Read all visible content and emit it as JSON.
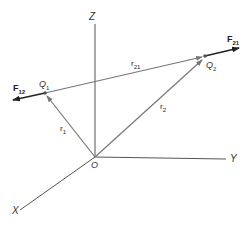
{
  "diagram": {
    "type": "vector-diagram",
    "colors": {
      "axis": "#555555",
      "vector": "#777777",
      "force": "#222222",
      "background": "#ffffff"
    },
    "axes": {
      "x": {
        "label": "X"
      },
      "y": {
        "label": "Y"
      },
      "z": {
        "label": "Z"
      },
      "origin": {
        "label": "O"
      }
    },
    "points": [
      {
        "id": "Q1",
        "label": "Q",
        "sub": "1"
      },
      {
        "id": "Q2",
        "label": "Q",
        "sub": "2"
      }
    ],
    "vectors": [
      {
        "id": "r1",
        "label": "r",
        "sub": "1",
        "from": "O",
        "to": "Q1"
      },
      {
        "id": "r2",
        "label": "r",
        "sub": "2",
        "from": "O",
        "to": "Q2"
      },
      {
        "id": "r21",
        "label": "r",
        "sub": "21",
        "from": "Q1",
        "to": "Q2"
      }
    ],
    "forces": [
      {
        "id": "F12",
        "label": "F",
        "sub": "12",
        "on": "Q1",
        "direction": "away from Q2"
      },
      {
        "id": "F21",
        "label": "F",
        "sub": "21",
        "on": "Q2",
        "direction": "away from Q1"
      }
    ]
  }
}
